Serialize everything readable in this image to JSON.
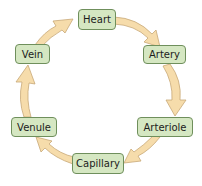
{
  "diagram": {
    "title": "",
    "type": "cycle",
    "colors": {
      "node_fill": "#d5e7c2",
      "node_border": "#6f8f5c",
      "arrow_fill": "#f6dcab",
      "arrow_stroke": "#c8a877"
    },
    "nodes": [
      {
        "id": "heart",
        "label": "Heart"
      },
      {
        "id": "artery",
        "label": "Artery"
      },
      {
        "id": "arteriole",
        "label": "Arteriole"
      },
      {
        "id": "capillary",
        "label": "Capillary"
      },
      {
        "id": "venule",
        "label": "Venule"
      },
      {
        "id": "vein",
        "label": "Vein"
      }
    ],
    "edges": [
      {
        "from": "Heart",
        "to": "Artery"
      },
      {
        "from": "Artery",
        "to": "Arteriole"
      },
      {
        "from": "Arteriole",
        "to": "Capillary"
      },
      {
        "from": "Capillary",
        "to": "Venule"
      },
      {
        "from": "Venule",
        "to": "Vein"
      },
      {
        "from": "Vein",
        "to": "Heart"
      }
    ]
  }
}
